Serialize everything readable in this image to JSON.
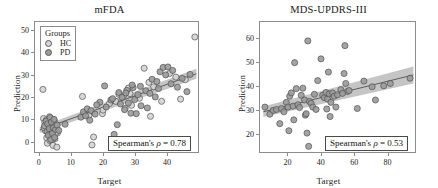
{
  "figure": {
    "panels": [
      {
        "id": "mfda",
        "title": "mFDA",
        "xlabel": "Target",
        "ylabel": "Prediction",
        "annotation_prefix": "Spearman's ",
        "annotation_symbol": "ρ",
        "annotation_value": " = 0.78",
        "legend": {
          "title": "Groups",
          "items": [
            {
              "label": "HC",
              "color": "#d4d4d4"
            },
            {
              "label": "PD",
              "color": "#9a9a9a"
            }
          ]
        }
      },
      {
        "id": "mds-updrs-iii",
        "title": "MDS-UPDRS-III",
        "xlabel": "Target",
        "ylabel": "Prediction",
        "annotation_prefix": "Spearman's ",
        "annotation_symbol": "ρ",
        "annotation_value": " = 0.53",
        "legend": null
      }
    ]
  },
  "colors": {
    "hc_fill": "#d4d4d4",
    "pd_fill": "#9a9a9a",
    "marker_edge": "#4f4f4f",
    "fit_line": "#5a5a5a",
    "ci_band": "#b5b5b5",
    "axis": "#8c8c8c",
    "text": "#1a1a1a"
  },
  "chart_data": [
    {
      "type": "scatter",
      "title": "mFDA",
      "xlabel": "Target",
      "ylabel": "Prediction",
      "xlim": [
        -1.5,
        50
      ],
      "ylim": [
        -5,
        54
      ],
      "xticks": [
        0,
        10,
        20,
        30,
        40
      ],
      "yticks": [
        0,
        10,
        20,
        30,
        40,
        50
      ],
      "grid": false,
      "legend_position": "top-left",
      "annotation": "Spearman's ρ = 0.78",
      "spearman_rho": 0.78,
      "series": [
        {
          "name": "HC",
          "color": "#d4d4d4",
          "points": [
            [
              1.0,
              23.4
            ],
            [
              1.2,
              10.2
            ],
            [
              1.6,
              8.4
            ],
            [
              2.0,
              5.0
            ],
            [
              2.2,
              1.4
            ],
            [
              2.4,
              -1.0
            ],
            [
              2.6,
              6.2
            ],
            [
              2.8,
              3.0
            ],
            [
              3.0,
              8.0
            ],
            [
              3.2,
              0.2
            ],
            [
              3.4,
              4.2
            ],
            [
              3.6,
              10.0
            ],
            [
              3.8,
              2.0
            ],
            [
              4.0,
              6.6
            ],
            [
              4.2,
              -2.0
            ],
            [
              4.4,
              5.4
            ],
            [
              4.6,
              9.2
            ],
            [
              4.8,
              1.0
            ],
            [
              5.0,
              7.0
            ],
            [
              5.4,
              -2.8
            ],
            [
              5.6,
              3.6
            ],
            [
              2.1,
              9.6
            ],
            [
              1.8,
              4.6
            ],
            [
              3.1,
              11.0
            ],
            [
              4.1,
              0.8
            ],
            [
              2.9,
              7.4
            ],
            [
              5.2,
              4.0
            ],
            [
              1.4,
              6.0
            ],
            [
              13.5,
              20.2
            ],
            [
              14.2,
              12.0
            ],
            [
              16.5,
              -1.8
            ],
            [
              17.0,
              1.8
            ],
            [
              19.8,
              12.4
            ],
            [
              24.0,
              18.0
            ],
            [
              26.5,
              20.6
            ],
            [
              27.0,
              14.8
            ],
            [
              28.5,
              21.5
            ],
            [
              29.0,
              16.2
            ],
            [
              31.5,
              19.4
            ],
            [
              33.0,
              33.0
            ],
            [
              34.5,
              26.6
            ],
            [
              35.0,
              11.2
            ],
            [
              36.0,
              24.6
            ],
            [
              38.5,
              18.0
            ],
            [
              41.0,
              30.6
            ],
            [
              43.0,
              29.0
            ],
            [
              44.5,
              19.0
            ],
            [
              46.0,
              27.8
            ],
            [
              49.0,
              47.2
            ],
            [
              28.0,
              24.0
            ],
            [
              25.0,
              21.2
            ],
            [
              22.0,
              17.0
            ],
            [
              20.0,
              14.0
            ],
            [
              15.5,
              11.5
            ]
          ]
        },
        {
          "name": "PD",
          "color": "#9a9a9a",
          "points": [
            [
              1.5,
              6.8
            ],
            [
              2.0,
              9.0
            ],
            [
              2.3,
              4.4
            ],
            [
              2.5,
              7.8
            ],
            [
              2.7,
              2.6
            ],
            [
              3.0,
              5.6
            ],
            [
              3.3,
              10.6
            ],
            [
              3.5,
              0.6
            ],
            [
              3.7,
              8.6
            ],
            [
              4.0,
              3.4
            ],
            [
              4.3,
              6.0
            ],
            [
              4.5,
              9.8
            ],
            [
              4.7,
              1.6
            ],
            [
              5.0,
              5.2
            ],
            [
              5.5,
              7.2
            ],
            [
              6.0,
              4.8
            ],
            [
              8.0,
              7.6
            ],
            [
              13.0,
              10.8
            ],
            [
              13.8,
              13.2
            ],
            [
              14.5,
              11.4
            ],
            [
              15.0,
              14.6
            ],
            [
              15.8,
              9.4
            ],
            [
              16.2,
              13.8
            ],
            [
              17.5,
              12.2
            ],
            [
              19.0,
              17.6
            ],
            [
              20.5,
              25.0
            ],
            [
              21.0,
              15.4
            ],
            [
              22.5,
              18.6
            ],
            [
              23.5,
              3.0
            ],
            [
              24.5,
              7.4
            ],
            [
              25.0,
              22.0
            ],
            [
              25.5,
              16.8
            ],
            [
              26.0,
              19.8
            ],
            [
              26.8,
              14.2
            ],
            [
              27.5,
              23.0
            ],
            [
              28.0,
              17.2
            ],
            [
              28.8,
              12.6
            ],
            [
              29.5,
              24.2
            ],
            [
              30.0,
              18.8
            ],
            [
              30.5,
              12.4
            ],
            [
              31.0,
              21.0
            ],
            [
              32.0,
              16.0
            ],
            [
              33.5,
              22.8
            ],
            [
              34.0,
              15.0
            ],
            [
              35.5,
              28.0
            ],
            [
              36.5,
              20.0
            ],
            [
              37.5,
              23.8
            ],
            [
              38.0,
              31.4
            ],
            [
              39.0,
              33.4
            ],
            [
              39.8,
              30.0
            ],
            [
              40.5,
              33.6
            ],
            [
              41.5,
              26.0
            ],
            [
              42.0,
              32.0
            ],
            [
              43.5,
              24.4
            ],
            [
              45.0,
              28.4
            ],
            [
              46.5,
              22.4
            ],
            [
              47.5,
              30.2
            ],
            [
              18.0,
              16.4
            ],
            [
              23.0,
              19.2
            ],
            [
              27.2,
              21.8
            ],
            [
              29.2,
              25.4
            ],
            [
              31.8,
              24.8
            ],
            [
              34.8,
              21.6
            ],
            [
              37.0,
              27.0
            ]
          ]
        }
      ],
      "fit_line": {
        "x": [
          0,
          49.5
        ],
        "y": [
          5.0,
          30.5
        ]
      },
      "ci_band": {
        "x": [
          0,
          49.5
        ],
        "lower": [
          3.6,
          28.2
        ],
        "upper": [
          6.4,
          32.8
        ]
      }
    },
    {
      "type": "scatter",
      "title": "MDS-UPDRS-III",
      "xlabel": "Target",
      "ylabel": "Prediction",
      "xlim": [
        3,
        97
      ],
      "ylim": [
        12,
        67
      ],
      "xticks": [
        20,
        40,
        60,
        80
      ],
      "yticks": [
        20,
        30,
        40,
        50,
        60
      ],
      "grid": false,
      "legend_position": "none",
      "annotation": "Spearman's ρ = 0.53",
      "spearman_rho": 0.53,
      "series": [
        {
          "name": "PD",
          "color": "#9a9a9a",
          "points": [
            [
              6.0,
              31.0
            ],
            [
              9.0,
              28.0
            ],
            [
              11.0,
              29.6
            ],
            [
              13.0,
              30.0
            ],
            [
              15.0,
              24.0
            ],
            [
              16.0,
              30.4
            ],
            [
              17.5,
              29.0
            ],
            [
              19.0,
              33.0
            ],
            [
              20.0,
              31.0
            ],
            [
              20.5,
              21.0
            ],
            [
              21.0,
              35.6
            ],
            [
              22.0,
              37.0
            ],
            [
              23.0,
              31.4
            ],
            [
              23.5,
              25.6
            ],
            [
              24.0,
              49.8
            ],
            [
              25.0,
              38.8
            ],
            [
              26.0,
              32.0
            ],
            [
              27.0,
              30.8
            ],
            [
              28.0,
              36.0
            ],
            [
              29.0,
              39.0
            ],
            [
              30.0,
              34.0
            ],
            [
              30.5,
              27.6
            ],
            [
              31.0,
              28.2
            ],
            [
              31.5,
              20.0
            ],
            [
              32.0,
              59.0
            ],
            [
              32.5,
              14.4
            ],
            [
              33.0,
              33.4
            ],
            [
              34.0,
              32.6
            ],
            [
              35.0,
              31.0
            ],
            [
              38.0,
              42.2
            ],
            [
              40.0,
              51.4
            ],
            [
              41.0,
              36.0
            ],
            [
              42.0,
              35.0
            ],
            [
              43.0,
              37.2
            ],
            [
              43.5,
              30.2
            ],
            [
              44.0,
              34.4
            ],
            [
              44.5,
              45.8
            ],
            [
              45.0,
              36.6
            ],
            [
              45.5,
              27.0
            ],
            [
              46.0,
              33.0
            ],
            [
              47.0,
              37.0
            ],
            [
              48.0,
              35.6
            ],
            [
              49.0,
              31.0
            ],
            [
              52.0,
              38.4
            ],
            [
              54.0,
              45.2
            ],
            [
              54.5,
              57.0
            ],
            [
              55.0,
              41.0
            ],
            [
              56.0,
              37.6
            ],
            [
              57.0,
              38.0
            ],
            [
              62.0,
              30.4
            ],
            [
              66.0,
              42.0
            ],
            [
              71.0,
              39.6
            ],
            [
              73.0,
              34.0
            ],
            [
              78.0,
              40.0
            ],
            [
              82.0,
              41.0
            ],
            [
              94.0,
              43.2
            ],
            [
              36.0,
              36.4
            ],
            [
              37.0,
              30.0
            ],
            [
              50.0,
              36.2
            ],
            [
              53.0,
              36.8
            ]
          ]
        }
      ],
      "fit_line": {
        "x": [
          5,
          96
        ],
        "y": [
          29.0,
          44.6
        ]
      },
      "ci_band": {
        "x": [
          5,
          96
        ],
        "lower": [
          26.8,
          41.0
        ],
        "upper": [
          31.2,
          48.2
        ]
      }
    }
  ]
}
